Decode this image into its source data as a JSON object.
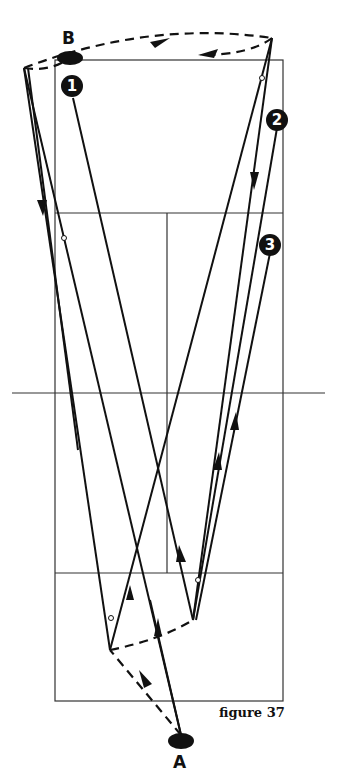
{
  "figure": {
    "caption": "figure 37",
    "player_labels": {
      "top": "B",
      "bottom": "A"
    },
    "markers": [
      {
        "id": "1",
        "label": "1"
      },
      {
        "id": "2",
        "label": "2"
      },
      {
        "id": "3",
        "label": "3"
      }
    ],
    "colors": {
      "ink": "#111111",
      "court": "#333333",
      "background": "#ffffff"
    }
  }
}
